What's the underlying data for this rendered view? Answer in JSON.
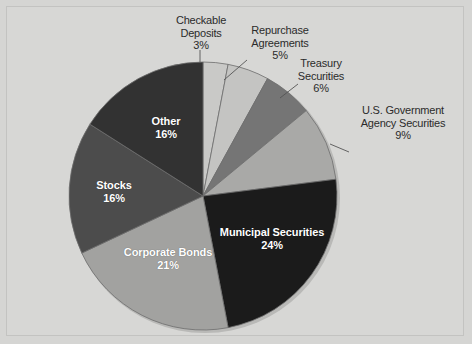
{
  "figure": {
    "background_color": "#d7d7d5",
    "border_color": "#c3c3c1"
  },
  "chart_data": {
    "type": "pie",
    "title": "",
    "subtitle": "",
    "xlabel": "",
    "ylabel": "",
    "legend_position": "none",
    "grid": false,
    "units": "percent",
    "start_angle_deg": 0,
    "direction": "clockwise",
    "center": {
      "x": 203,
      "y": 196
    },
    "radius": 134,
    "categories": [
      "Checkable Deposits",
      "Repurchase Agreements",
      "Treasury Securities",
      "U.S. Government Agency Securities",
      "Municipal Securities",
      "Corporate Bonds",
      "Stocks",
      "Other"
    ],
    "values": [
      3,
      5,
      6,
      9,
      24,
      21,
      16,
      16
    ],
    "colors": [
      "#c9c9c7",
      "#c4c4c2",
      "#757575",
      "#a9a9a7",
      "#1b1b1b",
      "#a2a2a0",
      "#4c4c4c",
      "#323232"
    ],
    "slices": [
      {
        "name": "Checkable Deposits",
        "value": 3,
        "label": "Checkable\nDeposits",
        "percent_text": "3%",
        "color": "#c9c9c7",
        "label_placement": "outside"
      },
      {
        "name": "Repurchase Agreements",
        "value": 5,
        "label": "Repurchase\nAgreements",
        "percent_text": "5%",
        "color": "#c4c4c2",
        "label_placement": "outside"
      },
      {
        "name": "Treasury Securities",
        "value": 6,
        "label": "Treasury\nSecurities",
        "percent_text": "6%",
        "color": "#757575",
        "label_placement": "outside"
      },
      {
        "name": "U.S. Government Agency Securities",
        "value": 9,
        "label": "U.S. Government\nAgency Securities",
        "percent_text": "9%",
        "color": "#a9a9a7",
        "label_placement": "outside"
      },
      {
        "name": "Municipal Securities",
        "value": 24,
        "label": "Municipal Securities",
        "percent_text": "24%",
        "color": "#1b1b1b",
        "label_placement": "inside"
      },
      {
        "name": "Corporate Bonds",
        "value": 21,
        "label": "Corporate Bonds",
        "percent_text": "21%",
        "color": "#a2a2a0",
        "label_placement": "inside"
      },
      {
        "name": "Stocks",
        "value": 16,
        "label": "Stocks",
        "percent_text": "16%",
        "color": "#4c4c4c",
        "label_placement": "inside"
      },
      {
        "name": "Other",
        "value": 16,
        "label": "Other",
        "percent_text": "16%",
        "color": "#323232",
        "label_placement": "inside"
      }
    ]
  },
  "labels": {
    "checkable_deposits": "Checkable\nDeposits\n3%",
    "repurchase_agreements": "Repurchase\nAgreements\n5%",
    "treasury_securities": "Treasury\nSecurities\n6%",
    "us_government_agency_securities": "U.S. Government\nAgency Securities\n9%",
    "municipal_securities": "Municipal Securities\n24%",
    "corporate_bonds": "Corporate Bonds\n21%",
    "stocks": "Stocks\n16%",
    "other": "Other\n16%"
  }
}
